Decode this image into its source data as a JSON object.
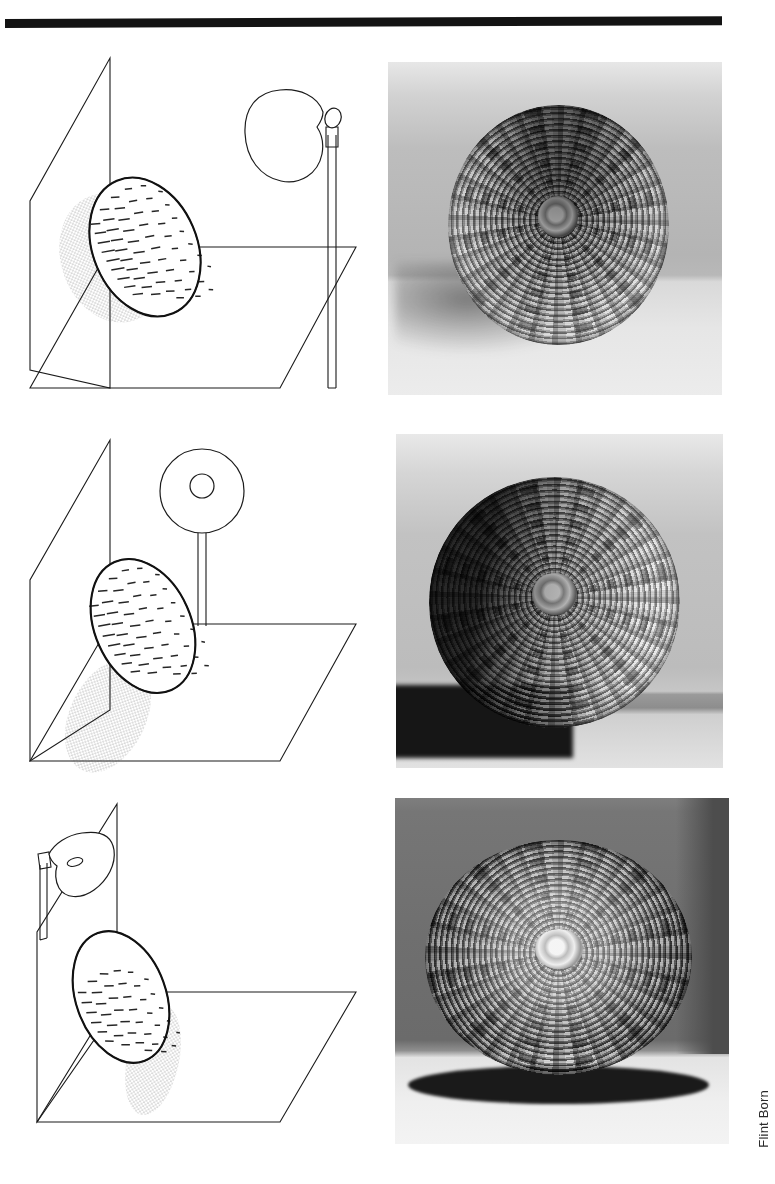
{
  "page": {
    "background_color": "#ffffff",
    "top_rule_color": "#131313",
    "credit": "Flint Born"
  },
  "rows": [
    {
      "id": "row-top-light",
      "diagram": {
        "name": "diagram-top-light",
        "planes": [
          "back-wall-plane",
          "ground-plane"
        ],
        "subject": "hatched-ellipse-basket",
        "light_source": "floor-lamp-with-shade-on-pole",
        "light_position": "upper-right, shade aimed left",
        "shadow": "stippled shadow cast left and below on wall"
      },
      "photo": {
        "name": "photo-basket-top-light",
        "subject": "round woven basket",
        "lighting": "light from above",
        "background_tone": "#b8b8b8",
        "floor_tone": "#e6e6e6"
      }
    },
    {
      "id": "row-side-light",
      "diagram": {
        "name": "diagram-side-light",
        "planes": [
          "back-wall-plane",
          "ground-plane"
        ],
        "subject": "hatched-ellipse-basket",
        "light_source": "ring-lamp-on-vertical-post",
        "light_position": "upper-center, above ground plane",
        "shadow": "stippled shadow cast down-left onto ground plane"
      },
      "photo": {
        "name": "photo-basket-side-light",
        "subject": "round woven basket",
        "lighting": "light from the right side",
        "background_tone": "#bcbcbc",
        "floor_tone": "#8d8d8d"
      }
    },
    {
      "id": "row-front-light",
      "diagram": {
        "name": "diagram-front-light",
        "planes": [
          "back-wall-plane",
          "ground-plane"
        ],
        "subject": "hatched-ellipse-basket",
        "light_source": "lamp-with-shade-on-short-stand",
        "light_position": "upper-left, shade aimed right and down",
        "shadow": "stippled shadow cast right and below onto ground plane"
      },
      "photo": {
        "name": "photo-basket-front-light",
        "subject": "round woven basket",
        "lighting": "frontal light, dark background",
        "background_tone": "#6f6f6f",
        "floor_tone": "#efefef",
        "cast_shadow": "hard dark ellipse beneath the basket"
      }
    }
  ]
}
